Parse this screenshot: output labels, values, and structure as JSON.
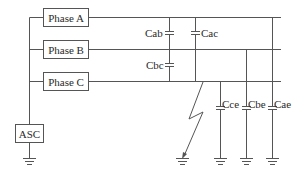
{
  "diagram": {
    "type": "three-phase circuit with arc suppression coil and phase capacitances",
    "colors": {
      "line": "#555555",
      "text": "#2a2a2a",
      "background": "#ffffff"
    },
    "phases": [
      {
        "id": "A",
        "label": "Phase A"
      },
      {
        "id": "B",
        "label": "Phase B"
      },
      {
        "id": "C",
        "label": "Phase C"
      }
    ],
    "asc": {
      "label": "ASC"
    },
    "capacitors": {
      "cab": "Cab",
      "cac": "Cac",
      "cbc": "Cbc",
      "cce": "Cce",
      "cbe": "Cbe",
      "cae": "Cae"
    },
    "fault": {
      "type": "ground-fault-arrow",
      "phase": "C"
    },
    "grounds": [
      "asc",
      "fault",
      "cce",
      "cbe",
      "cae"
    ]
  }
}
